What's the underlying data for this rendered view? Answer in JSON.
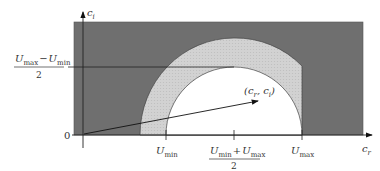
{
  "diagram": {
    "axes": {
      "x_label": "c",
      "x_label_sub": "r",
      "y_label": "c",
      "y_label_sub": "i",
      "origin_label": "0"
    },
    "x_ticks": {
      "u_min": {
        "main": "U",
        "sub": "min"
      },
      "u_mid": {
        "num_left": "U",
        "num_left_sub": "min",
        "plus": "+",
        "num_right": "U",
        "num_right_sub": "max",
        "den": "2"
      },
      "u_max": {
        "main": "U",
        "sub": "max"
      }
    },
    "y_tick": {
      "num_left": "U",
      "num_left_sub": "max",
      "minus": "−",
      "num_right": "U",
      "num_right_sub": "min",
      "den": "2"
    },
    "point_label": "(c",
    "point_label_sub_r": "r",
    "point_label_mid": ", c",
    "point_label_sub_i": "i",
    "point_label_end": ")",
    "colors": {
      "dark_region": "#6f6f6f",
      "band_region": "#cfcfcf",
      "inner_region": "#ffffff",
      "lines": "#222222"
    }
  }
}
